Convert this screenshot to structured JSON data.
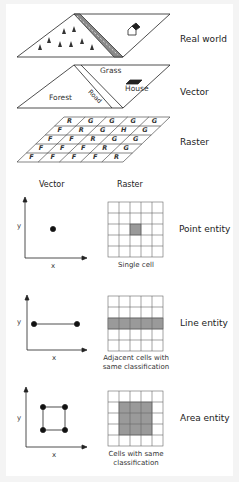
{
  "layers": {
    "real_world": {
      "label": "Real world"
    },
    "vector": {
      "label": "Vector",
      "regions": {
        "forest": "Forest",
        "road": "Road",
        "grass": "Grass",
        "house": "House"
      }
    },
    "raster": {
      "label": "Raster",
      "grid": [
        [
          "R",
          "G",
          "G",
          "G",
          "G"
        ],
        [
          "F",
          "R",
          "G",
          "H",
          "G"
        ],
        [
          "F",
          "F",
          "R",
          "G",
          "G"
        ],
        [
          "F",
          "F",
          "F",
          "R",
          "G"
        ],
        [
          "F",
          "F",
          "F",
          "F",
          "R"
        ]
      ]
    }
  },
  "columns": {
    "vector": "Vector",
    "raster": "Raster"
  },
  "axes": {
    "x": "x",
    "y": "y"
  },
  "entities": [
    {
      "label": "Point entity",
      "caption": "Single cell"
    },
    {
      "label": "Line entity",
      "caption_line1": "Adjacent cells with",
      "caption_line2": "same classification"
    },
    {
      "label": "Area entity",
      "caption_line1": "Cells with same",
      "caption_line2": "classification"
    }
  ],
  "colors": {
    "shade": "#9a9a9a",
    "line": "#222222",
    "grid": "#555555"
  }
}
